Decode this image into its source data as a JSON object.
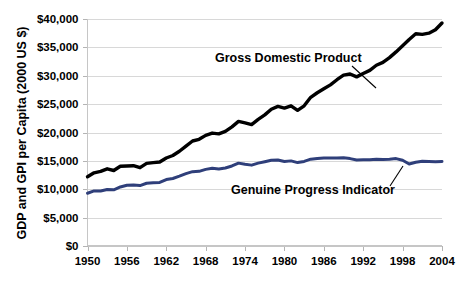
{
  "chart_data": {
    "type": "line",
    "title": "",
    "xlabel": "",
    "ylabel": "GDP and GPI per Capita (2000 US $)",
    "xlim": [
      1950,
      2004
    ],
    "ylim": [
      0,
      40000
    ],
    "grid": true,
    "legend_position": "inline-annotation",
    "x_ticks": [
      "1950",
      "1956",
      "1962",
      "1968",
      "1974",
      "1980",
      "1986",
      "1992",
      "1998",
      "2004"
    ],
    "x_tick_values": [
      1950,
      1956,
      1962,
      1968,
      1974,
      1980,
      1986,
      1992,
      1998,
      2004
    ],
    "y_ticks": [
      "$0",
      "$5,000",
      "$10,000",
      "$15,000",
      "$20,000",
      "$25,000",
      "$30,000",
      "$35,000",
      "$40,000"
    ],
    "y_tick_values": [
      0,
      5000,
      10000,
      15000,
      20000,
      25000,
      30000,
      35000,
      40000
    ],
    "x": [
      1950,
      1951,
      1952,
      1953,
      1954,
      1955,
      1956,
      1957,
      1958,
      1959,
      1960,
      1961,
      1962,
      1963,
      1964,
      1965,
      1966,
      1967,
      1968,
      1969,
      1970,
      1971,
      1972,
      1973,
      1974,
      1975,
      1976,
      1977,
      1978,
      1979,
      1980,
      1981,
      1982,
      1983,
      1984,
      1985,
      1986,
      1987,
      1988,
      1989,
      1990,
      1991,
      1992,
      1993,
      1994,
      1995,
      1996,
      1997,
      1998,
      1999,
      2000,
      2001,
      2002,
      2003,
      2004
    ],
    "series": [
      {
        "name": "Gross Domestic Product",
        "color": "#000000",
        "stroke_width": 3.4,
        "annotation": "Gross Domestic Product",
        "values": [
          12200,
          12900,
          13150,
          13600,
          13300,
          14050,
          14100,
          14150,
          13800,
          14550,
          14700,
          14800,
          15500,
          15950,
          16700,
          17600,
          18500,
          18800,
          19500,
          19900,
          19750,
          20200,
          21000,
          21950,
          21700,
          21400,
          22300,
          23100,
          24100,
          24600,
          24300,
          24700,
          23900,
          24700,
          26200,
          27000,
          27700,
          28400,
          29300,
          30100,
          30300,
          29800,
          30400,
          30950,
          31850,
          32350,
          33200,
          34200,
          35300,
          36400,
          37400,
          37300,
          37500,
          38100,
          39300
        ]
      },
      {
        "name": "Genuine Progress Indicator",
        "color": "#2f3f7a",
        "stroke_width": 3.0,
        "annotation": "Genuine Progress Indicator",
        "values": [
          9300,
          9700,
          9700,
          9950,
          9900,
          10400,
          10700,
          10750,
          10650,
          11050,
          11150,
          11200,
          11700,
          11900,
          12300,
          12750,
          13100,
          13150,
          13500,
          13700,
          13550,
          13750,
          14100,
          14600,
          14400,
          14250,
          14600,
          14850,
          15100,
          15150,
          14900,
          15000,
          14700,
          14900,
          15300,
          15400,
          15500,
          15500,
          15500,
          15550,
          15400,
          15150,
          15200,
          15200,
          15300,
          15250,
          15300,
          15400,
          15100,
          14450,
          14750,
          14950,
          14900,
          14850,
          14900
        ]
      }
    ],
    "annotations": [
      {
        "name": "gdp-annotation",
        "text": "Gross Domestic Product",
        "x_px": 215,
        "y_px": 62,
        "leader": {
          "x1": 352,
          "y1": 66,
          "x2": 376,
          "y2": 88
        }
      },
      {
        "name": "gpi-annotation",
        "text": "Genuine Progress Indicator",
        "x_px": 231,
        "y_px": 194,
        "leader": {
          "x1": 390,
          "y1": 186,
          "x2": 403,
          "y2": 166
        }
      }
    ]
  },
  "colors": {
    "gdp": "#000000",
    "gpi": "#2f3f7a",
    "gridline": "#d8d8d8",
    "axis": "#c6c6c6",
    "background": "#ffffff"
  }
}
